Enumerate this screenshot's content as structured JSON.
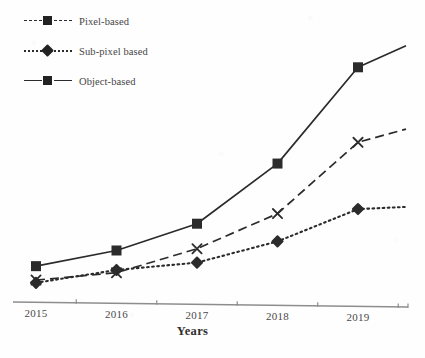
{
  "chart_data": {
    "type": "line",
    "title": "",
    "subtitle": "",
    "xlabel": "Years",
    "ylabel": "",
    "categories": [
      "2015",
      "2016",
      "2017",
      "2018",
      "2019"
    ],
    "xtick_labels": [
      "2015",
      "2016",
      "2017",
      "2018",
      "2019"
    ],
    "ytick_labels": [],
    "ylim": [
      0,
      100
    ],
    "grid": false,
    "y_axis_visible": false,
    "x_axis_visible": true,
    "legend_position": "top-left",
    "annotations": [],
    "series": [
      {
        "name": "Pixel-based",
        "line_style": "dashed",
        "marker": "x",
        "color": "#2b2b2b",
        "values": [
          8,
          11,
          20,
          33,
          59
        ],
        "extrapolated_end_value": 64
      },
      {
        "name": "Sub-pixel based",
        "line_style": "dotted",
        "marker": "diamond",
        "color": "#2b2b2b",
        "values": [
          7,
          12,
          15,
          23,
          35
        ],
        "extrapolated_end_value": 36
      },
      {
        "name": "Object-based",
        "line_style": "solid",
        "marker": "square",
        "color": "#2b2b2b",
        "values": [
          13,
          19,
          29,
          51,
          86
        ],
        "extrapolated_end_value": 94
      }
    ]
  },
  "legend": {
    "items": [
      {
        "label": "Pixel-based",
        "line_style": "dashed",
        "marker": "square"
      },
      {
        "label": "Sub-pixel based",
        "line_style": "dotted",
        "marker": "diamond"
      },
      {
        "label": "Object-based",
        "line_style": "solid",
        "marker": "square"
      }
    ]
  },
  "axis": {
    "x_title": "Years"
  },
  "colors": {
    "ink": "#2b2b2b",
    "axis": "#8d8d8d",
    "text": "#454545",
    "background": "#fefefe"
  }
}
